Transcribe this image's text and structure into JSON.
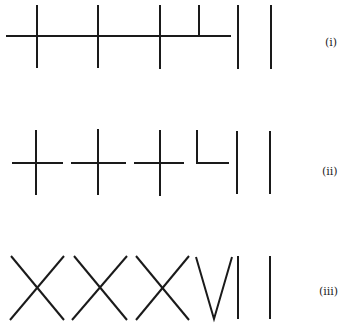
{
  "figure": {
    "stroke_color": "#1a1a1a",
    "rows": [
      {
        "label": "(i)",
        "meaning": "three crosses and a half-cross on a continuous line, followed by two vertical strokes"
      },
      {
        "label": "(ii)",
        "meaning": "three separated crosses, an L-shape, and two vertical strokes"
      },
      {
        "label": "(iii)",
        "meaning": "XXXVII"
      }
    ]
  }
}
